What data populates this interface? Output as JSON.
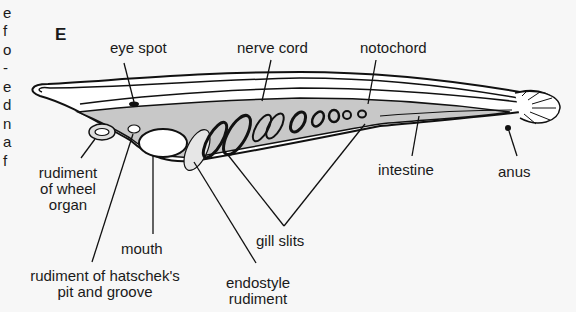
{
  "figure": {
    "panel_label": "E",
    "left_margin_fragments": [
      "e",
      "f",
      "o",
      "-",
      "e",
      "d",
      "n",
      "a",
      "f"
    ],
    "labels": {
      "eye_spot": "eye spot",
      "nerve_cord": "nerve cord",
      "notochord": "notochord",
      "intestine": "intestine",
      "anus": "anus",
      "rudiment_wheel_organ": [
        "rudiment",
        "of wheel",
        "organ"
      ],
      "mouth": "mouth",
      "gill_slits": "gill slits",
      "rudiment_hatschek": [
        "rudiment of hatschek's",
        "pit and groove"
      ],
      "endostyle_rudiment": [
        "endostyle",
        "rudiment"
      ]
    },
    "colors": {
      "body_fill": "#ffffff",
      "gut_fill": "#c8c8c8",
      "outline": "#111111",
      "background": "#f7f7f7"
    }
  }
}
